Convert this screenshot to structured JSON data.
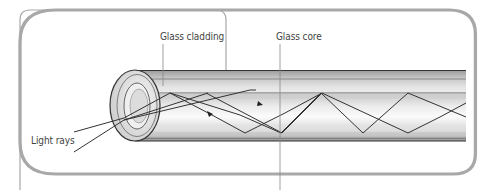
{
  "diagram": {
    "labels": {
      "cladding": "Glass cladding",
      "core": "Glass core",
      "rays": "Light rays"
    },
    "colors": {
      "border": "#a0a0a0",
      "outline": "#333333",
      "cladding_fill": "#d4d4d4",
      "core_fill": "#efefef",
      "ray": "#333333"
    }
  }
}
